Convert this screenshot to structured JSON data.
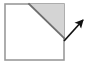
{
  "figure": {
    "canvas": {
      "width": 89,
      "height": 67,
      "background": "#ffffff"
    },
    "colors": {
      "square_stroke": "#9a9a9a",
      "square_fill": "#ffffff",
      "triangle_fill": "#d4d4d4",
      "triangle_stroke": "#8c8c8c",
      "diagonal_stroke": "#6e6e6e",
      "arrow_color": "#111111"
    },
    "square": {
      "label": "square-outline",
      "x": 5,
      "y": 4,
      "width": 59,
      "height": 56,
      "stroke_width": 1.6
    },
    "diagonal": {
      "label": "diagonal-line",
      "x1": 29,
      "y1": 4,
      "x2": 64,
      "y2": 38,
      "stroke_width": 1.8
    },
    "shaded_triangle": {
      "label": "shaded-triangle",
      "points": "29,4 64,4 64,38",
      "fill": "#d4d4d4"
    },
    "arrow": {
      "label": "direction-arrow",
      "tail_x": 64,
      "tail_y": 41,
      "tip_x": 83,
      "tip_y": 20,
      "shaft_width": 1.7,
      "head_length": 9,
      "head_width": 7,
      "direction": "up-right",
      "angle_degrees": 48
    }
  }
}
